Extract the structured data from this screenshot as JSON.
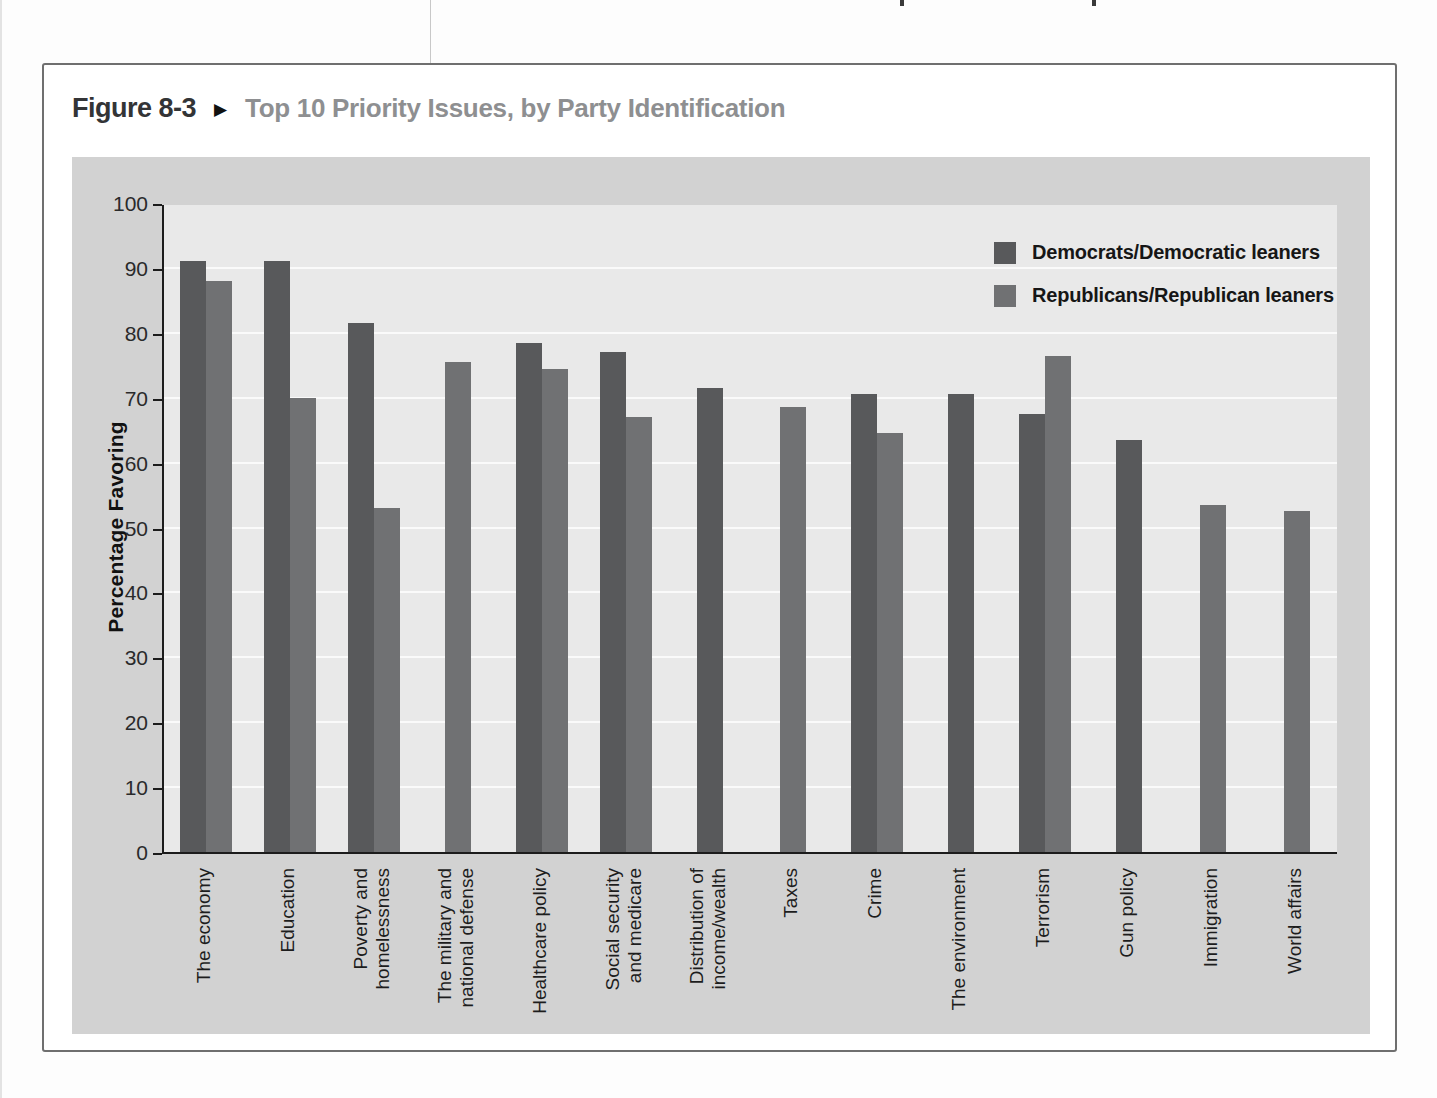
{
  "page": {
    "figure_label": "Figure 8-3",
    "figure_marker": "▶",
    "figure_title": "Top 10 Priority Issues, by Party Identification"
  },
  "chart_data": {
    "type": "bar",
    "title": "Top 10 Priority Issues, by Party Identification",
    "xlabel": "",
    "ylabel": "Percentage Favoring",
    "ylim": [
      0,
      100
    ],
    "ytick_step": 10,
    "ytick_labels": [
      "0",
      "10",
      "20",
      "30",
      "40",
      "50",
      "60",
      "70",
      "80",
      "90",
      "100"
    ],
    "grid": true,
    "legend_position": "top-right",
    "plot_bg": "#e9e9e9",
    "panel_bg": "#d2d2d2",
    "series": [
      {
        "name": "Democrats/Democratic leaners",
        "color": "#58595b"
      },
      {
        "name": "Republicans/Republican leaners",
        "color": "#707173"
      }
    ],
    "categories": [
      "The economy",
      "Education",
      "Poverty and\nhomelessness",
      "The military and\nnational defense",
      "Healthcare policy",
      "Social security\nand medicare",
      "Distribution of\nincome/wealth",
      "Taxes",
      "Crime",
      "The environment",
      "Terrorism",
      "Gun policy",
      "Immigration",
      "World affairs"
    ],
    "values": {
      "democrats": [
        91,
        91,
        81.5,
        null,
        78.5,
        77,
        71.5,
        null,
        70.5,
        70.5,
        67.5,
        63.5,
        null,
        null
      ],
      "republicans": [
        88,
        70,
        53,
        75.5,
        74.5,
        67,
        null,
        68.5,
        64.5,
        null,
        76.5,
        null,
        53.5,
        52.5
      ]
    }
  }
}
